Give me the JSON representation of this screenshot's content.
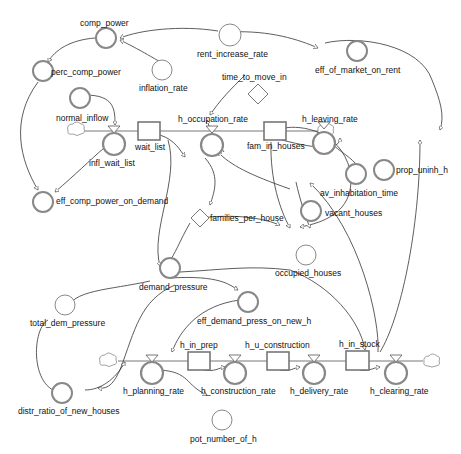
{
  "diagram": {
    "type": "system-dynamics-stock-flow",
    "stocks": [
      {
        "id": "wait_list",
        "label": "wait_list"
      },
      {
        "id": "fam_in_houses",
        "label": "fam_in_houses"
      },
      {
        "id": "h_in_prep",
        "label": "h_in_prep"
      },
      {
        "id": "h_u_construction",
        "label": "h_u_construction"
      },
      {
        "id": "h_in_stock",
        "label": "h_in_stock"
      }
    ],
    "flows": [
      {
        "id": "infl_wait_list",
        "label": "infl_wait_list"
      },
      {
        "id": "h_occupation_rate",
        "label": "h_occupation_rate"
      },
      {
        "id": "h_leaving_rate",
        "label": "h_leaving_rate"
      },
      {
        "id": "h_planning_rate",
        "label": "h_planning_rate"
      },
      {
        "id": "h_construction_rate",
        "label": "h_construction_rate"
      },
      {
        "id": "h_delivery_rate",
        "label": "h_delivery_rate"
      },
      {
        "id": "h_clearing_rate",
        "label": "h_clearing_rate"
      }
    ],
    "converters": [
      {
        "id": "comp_power",
        "label": "comp_power"
      },
      {
        "id": "perc_comp_power",
        "label": "perc_comp_power"
      },
      {
        "id": "rent_increase_rate",
        "label": "rent_increase_rate"
      },
      {
        "id": "inflation_rate",
        "label": "inflation_rate"
      },
      {
        "id": "eff_of_market_on_rent",
        "label": "eff_of_market_on_rent"
      },
      {
        "id": "normal_inflow",
        "label": "normal_inflow"
      },
      {
        "id": "eff_comp_power_on_demand",
        "label": "eff_comp_power_on_demand"
      },
      {
        "id": "prop_uninh_h",
        "label": "prop_uninh_h"
      },
      {
        "id": "av_inhabitation_time",
        "label": "av_inhabitation_time"
      },
      {
        "id": "vacant_houses",
        "label": "vacant_houses"
      },
      {
        "id": "occupied_houses",
        "label": "occupied_houses"
      },
      {
        "id": "demand_pressure",
        "label": "demand_pressure"
      },
      {
        "id": "total_dem_pressure",
        "label": "total_dem_pressure"
      },
      {
        "id": "eff_demand_press_on_new_h",
        "label": "eff_demand_press_on_new_h"
      },
      {
        "id": "distr_ratio_of_new_houses",
        "label": "distr_ratio_of_new_houses"
      },
      {
        "id": "pot_number_of_h",
        "label": "pot_number_of_h"
      }
    ],
    "constants": [
      {
        "id": "time_to_move_in",
        "label": "time_to_move_in"
      },
      {
        "id": "families_per_house",
        "label": "families_per_house"
      }
    ]
  },
  "labels": {
    "comp_power": "comp_power",
    "perc_comp_power": "perc_comp_power",
    "rent_increase_rate": "rent_increase_rate",
    "inflation_rate": "inflation_rate",
    "eff_of_market_on_rent": "eff_of_market_on_rent",
    "time_to_move_in": "time_to_move_in",
    "normal_inflow": "normal_inflow",
    "infl_wait_list": "infl_wait_list",
    "wait_list": "wait_list",
    "h_occupation_rate": "h_occupation_rate",
    "fam_in_houses": "fam_in_houses",
    "h_leaving_rate": "h_leaving_rate",
    "av_inhabitation_time": "av_inhabitation_time",
    "prop_uninh_h": "prop_uninh_h",
    "eff_comp_power_on_demand": "eff_comp_power_on_demand",
    "families_per_house": "families_per_house",
    "vacant_houses": "vacant_houses",
    "occupied_houses": "occupied_houses",
    "demand_pressure": "demand_pressure",
    "total_dem_pressure": "total_dem_pressure",
    "eff_demand_press_on_new_h": "eff_demand_press_on_new_h",
    "h_in_prep": "h_in_prep",
    "h_u_construction": "h_u_construction",
    "h_in_stock": "h_in_stock",
    "distr_ratio_of_new_houses": "distr_ratio_of_new_houses",
    "h_planning_rate": "h_planning_rate",
    "h_construction_rate": "h_construction_rate",
    "h_delivery_rate": "h_delivery_rate",
    "h_clearing_rate": "h_clearing_rate",
    "pot_number_of_h": "pot_number_of_h"
  }
}
